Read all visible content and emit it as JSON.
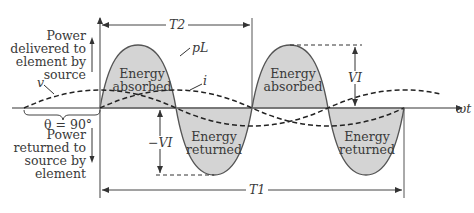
{
  "diagram": {
    "labels": {
      "power_delivered": [
        "Power",
        "delivered to",
        "element by",
        "source"
      ],
      "power_returned": [
        "Power",
        "returned to",
        "source by",
        "element"
      ],
      "energy_absorbed_1": [
        "Energy",
        "absorbed"
      ],
      "energy_absorbed_2": [
        "Energy",
        "absorbed"
      ],
      "energy_returned_1": [
        "Energy",
        "returned"
      ],
      "energy_returned_2": [
        "Energy",
        "returned"
      ],
      "theta": "θ = 90°",
      "v": "v",
      "i": "i",
      "pL": "pL",
      "T2": "T2",
      "T1": "T1",
      "VI": "VI",
      "neg_VI": "−VI",
      "omega_t": "ωt"
    },
    "colors": {
      "fill": "#d4d4d4",
      "stroke": "#555555",
      "dashed": "#222222",
      "text": "#3a3a3a"
    }
  }
}
